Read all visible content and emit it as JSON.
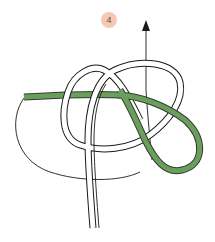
{
  "diagram": {
    "step_number": "4",
    "colors": {
      "badge_fill": "#f6c8b4",
      "working_end": "#6b9e5e",
      "working_end_outline": "#2f3f2a",
      "rope_outline": "#1a1a1a",
      "rope_fill": "#ffffff",
      "arrow": "#1a1a1a"
    },
    "elements": [
      {
        "type": "step-badge",
        "label": "4"
      },
      {
        "type": "direction-arrow",
        "direction": "up"
      },
      {
        "type": "rope-standing-part",
        "color": "white"
      },
      {
        "type": "rope-working-end",
        "color": "green"
      },
      {
        "type": "thin-guide-line"
      }
    ]
  }
}
